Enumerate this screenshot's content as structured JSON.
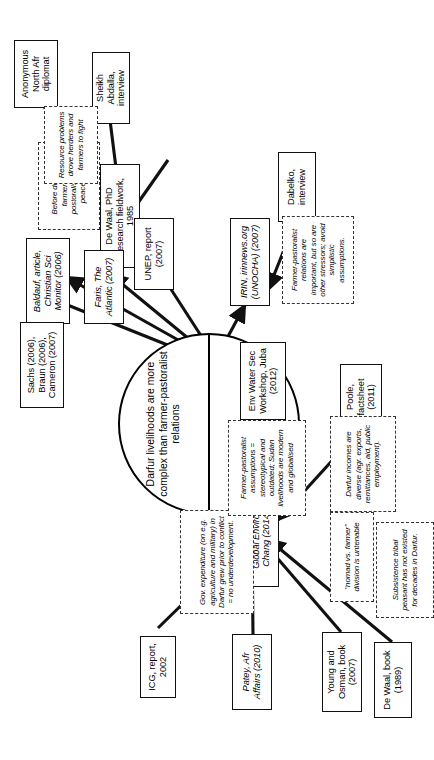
{
  "figure": {
    "type": "concept-map",
    "orientation": "rotated-90-ccw",
    "hub": {
      "top_half": "Darfur livelihoods are more complex than farmer-pastoralist relations",
      "bottom_half": "Drought/ resource scarcity led to farmer-pastoralist conflicts"
    },
    "sources": [
      {
        "id": "young_osman",
        "label": "Young and Osman, book (2007)"
      },
      {
        "id": "patey",
        "label": "Patey, Afr Affairs (2010)",
        "italic": true
      },
      {
        "id": "icg",
        "label": "ICG, report, 2002"
      },
      {
        "id": "dewaal_1989",
        "label": "De Waal, book (1989)"
      },
      {
        "id": "selby_hoffmann",
        "label": "Selby and Hoffmann, Global Environ Chang (2014)"
      },
      {
        "id": "poole",
        "label": "Poole, factsheet (2011)"
      },
      {
        "id": "env_water_sec",
        "label": "Env Water Sec Workshop, Juba (2012)"
      },
      {
        "id": "irin",
        "label": "IRIN, irinnews.org (UNOCHA) (2007)"
      },
      {
        "id": "dabelko",
        "label": "Dabelko, interview"
      },
      {
        "id": "sheikh_abdalla",
        "label": "Sheikh Abdalla, interview"
      },
      {
        "id": "dewaal_phd",
        "label": "De Waal, PhD research fieldwork, 1985"
      },
      {
        "id": "faris",
        "label": "Faris, The Atlantic (2007)"
      },
      {
        "id": "unep",
        "label": "UNEP, report (2007)"
      },
      {
        "id": "baldauf",
        "label": "Baldauf, article, Christian Sci Monitor (2006)"
      },
      {
        "id": "sachs_braun_cameron",
        "label": "Sachs (2006), Braun (2006), Cameron (2007)"
      },
      {
        "id": "anon_diplomat",
        "label": "Anonymous North Afr diplomat"
      }
    ],
    "notes": [
      {
        "id": "note_nomad",
        "text": "\"nomad vs. farmer\" division is untenable"
      },
      {
        "id": "note_gov_exp",
        "text": "Gov. expenditure (on e.g. agriculture and military) in Darfur grew prior to conflict = no underdevelopment."
      },
      {
        "id": "note_subsistence",
        "text": "Subsistence tribal peasant has not existed for decades in Darfur."
      },
      {
        "id": "note_incomes",
        "text": "Darfur incomes are diverse (agr. exports, remittances, aid, public employment)."
      },
      {
        "id": "note_assumptions",
        "text": "Farmer-pastoralist assumptions = stereotypical and outdated; Sudan livelihoods are modern and globalised"
      },
      {
        "id": "note_relations",
        "text": "Farmer-pastoralist relations are important, but so are other stressors; avoid simplistic assumptions."
      },
      {
        "id": "note_peaceful",
        "text": "Before droughts, farmers and postoralists lived peacefully"
      },
      {
        "id": "note_resource",
        "text": "Resource problems drove herders and farmers to fight"
      }
    ],
    "colors": {
      "stroke": "#111111",
      "note_stroke": "#333333",
      "background": "#ffffff"
    }
  }
}
